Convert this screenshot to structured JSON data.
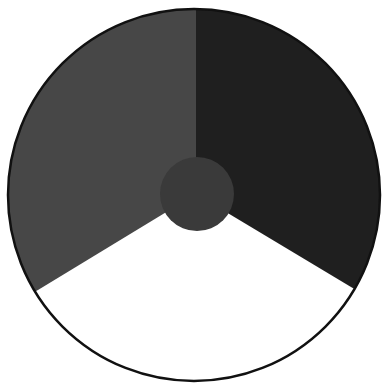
{
  "diagram": {
    "type": "three-sector disc with central hub",
    "outer_circle": {
      "cx": 194,
      "cy": 195,
      "r": 186,
      "stroke": "#111111",
      "stroke_width": 2.5
    },
    "center_circle": {
      "cx": 197,
      "cy": 194,
      "r": 37,
      "fill": "#3a3a3a"
    },
    "sectors": [
      {
        "name": "upper-left-sector",
        "fill": "#474747"
      },
      {
        "name": "upper-right-sector",
        "fill": "#1f1f1f"
      },
      {
        "name": "bottom-sector",
        "fill": "#ffffff"
      }
    ],
    "dividers": {
      "top_x": 196,
      "left_edge_point": [
        38,
        290
      ],
      "right_edge_point": [
        351,
        287
      ]
    }
  }
}
